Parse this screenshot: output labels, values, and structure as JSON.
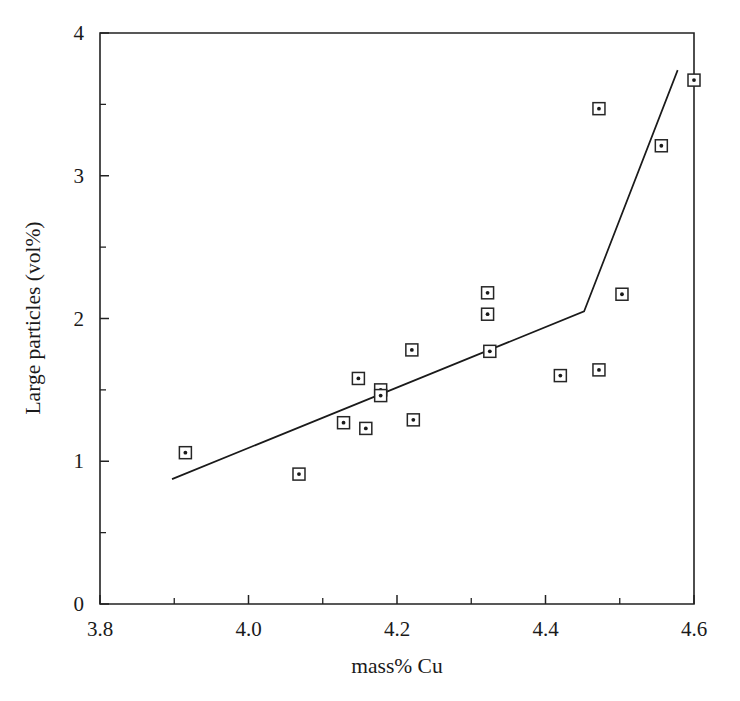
{
  "chart_data": {
    "type": "scatter",
    "title": "",
    "xlabel": "mass% Cu",
    "ylabel": "Large particles (vol%)",
    "xlim": [
      3.8,
      4.6
    ],
    "ylim": [
      0,
      4
    ],
    "grid": false,
    "legend": "none",
    "x_ticks": [
      3.8,
      4.0,
      4.2,
      4.4,
      4.6
    ],
    "x_tick_labels": [
      "3.8",
      "4.0",
      "4.2",
      "4.4",
      "4.6"
    ],
    "x_minor_ticks": [
      3.9,
      4.1,
      4.3,
      4.5
    ],
    "y_ticks": [
      0,
      1,
      2,
      3,
      4
    ],
    "y_tick_labels": [
      "0",
      "1",
      "2",
      "3",
      "4"
    ],
    "y_minor_ticks": [
      0.5,
      1.5,
      2.5,
      3.5
    ],
    "marker_style": "open-square-with-center-dot",
    "points": [
      {
        "x": 3.915,
        "y": 1.06
      },
      {
        "x": 4.068,
        "y": 0.91
      },
      {
        "x": 4.128,
        "y": 1.27
      },
      {
        "x": 4.148,
        "y": 1.58
      },
      {
        "x": 4.158,
        "y": 1.23
      },
      {
        "x": 4.178,
        "y": 1.5
      },
      {
        "x": 4.178,
        "y": 1.46
      },
      {
        "x": 4.22,
        "y": 1.78
      },
      {
        "x": 4.222,
        "y": 1.29
      },
      {
        "x": 4.322,
        "y": 2.18
      },
      {
        "x": 4.322,
        "y": 2.03
      },
      {
        "x": 4.325,
        "y": 1.77
      },
      {
        "x": 4.42,
        "y": 1.6
      },
      {
        "x": 4.472,
        "y": 3.47
      },
      {
        "x": 4.472,
        "y": 1.64
      },
      {
        "x": 4.503,
        "y": 2.17
      },
      {
        "x": 4.556,
        "y": 3.21
      },
      {
        "x": 4.6,
        "y": 3.67
      }
    ],
    "fit_line": {
      "type": "bilinear",
      "vertices": [
        {
          "x": 3.897,
          "y": 0.875
        },
        {
          "x": 4.452,
          "y": 2.05
        },
        {
          "x": 4.578,
          "y": 3.74
        }
      ]
    }
  },
  "axes": {
    "x_title": "mass% Cu",
    "y_title": "Large particles (vol%)"
  }
}
